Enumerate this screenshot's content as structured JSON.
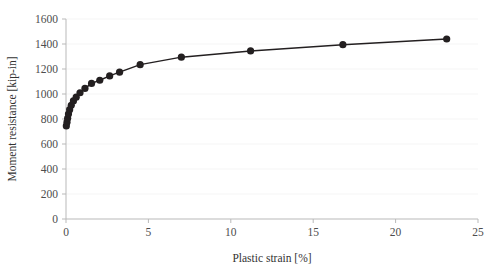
{
  "chart_data": {
    "type": "line",
    "title": "",
    "xlabel": "Plastic strain [%]",
    "ylabel": "Moment resistance [kip-in]",
    "xlim": [
      0,
      25
    ],
    "ylim": [
      0,
      1600
    ],
    "xticks": [
      0,
      5,
      10,
      15,
      20,
      25
    ],
    "yticks": [
      0,
      200,
      400,
      600,
      800,
      1000,
      1200,
      1400,
      1600
    ],
    "xtick_labels": [
      "0",
      "5",
      "10",
      "15",
      "20",
      "25"
    ],
    "ytick_labels": [
      "0",
      "200",
      "400",
      "600",
      "800",
      "1000",
      "1200",
      "1400",
      "1600"
    ],
    "grid": true,
    "grid_axis": "y",
    "legend": false,
    "legend_position": "none",
    "marker": "circle",
    "marker_color": "#231f20",
    "line_color": "#231f20",
    "series": [
      {
        "name": "Moment resistance vs plastic strain",
        "x": [
          0.02,
          0.06,
          0.1,
          0.15,
          0.22,
          0.32,
          0.45,
          0.62,
          0.85,
          1.15,
          1.55,
          2.05,
          2.65,
          3.25,
          4.5,
          7.0,
          11.2,
          16.8,
          23.1
        ],
        "y": [
          745,
          775,
          805,
          840,
          875,
          910,
          945,
          975,
          1010,
          1045,
          1085,
          1110,
          1145,
          1175,
          1235,
          1295,
          1345,
          1395,
          1440
        ]
      }
    ]
  },
  "figure": {
    "background": "#ffffff",
    "axis_color": "#b9b9b9",
    "grid_color": "#f2f2f2",
    "text_color": "#4d4d4d"
  }
}
